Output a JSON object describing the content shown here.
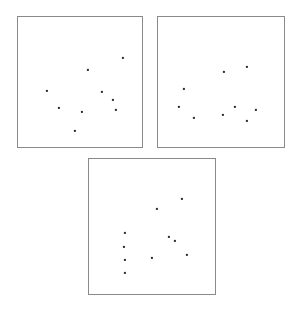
{
  "figure": {
    "title": "",
    "background_color": "#ffffff",
    "width": 300,
    "height": 313,
    "panel_border_color": "#8a8a8a",
    "point_color": "#2b2b2b",
    "point_size_px": 2.2
  },
  "chart_data": {
    "type": "scatter",
    "title": "",
    "xlabel": "",
    "ylabel": "",
    "grid": false,
    "legend_position": "none",
    "axis_ticks": false,
    "panel_layout": "2 panels on top row, 1 panel centered on bottom row",
    "panels": [
      {
        "name": "panel-top-left",
        "label": "",
        "frame_px": {
          "left": 17,
          "top": 16,
          "width": 126,
          "height": 132
        },
        "xlim": [
          0,
          1
        ],
        "ylim": [
          0,
          1
        ],
        "n_points": 9,
        "points": [
          {
            "x": 0.833,
            "y": 0.689
          },
          {
            "x": 0.556,
            "y": 0.598
          },
          {
            "x": 0.23,
            "y": 0.439
          },
          {
            "x": 0.667,
            "y": 0.432
          },
          {
            "x": 0.754,
            "y": 0.371
          },
          {
            "x": 0.325,
            "y": 0.311
          },
          {
            "x": 0.508,
            "y": 0.28
          },
          {
            "x": 0.778,
            "y": 0.295
          },
          {
            "x": 0.452,
            "y": 0.136
          }
        ],
        "points_px": [
          {
            "x": 122,
            "y": 57
          },
          {
            "x": 87,
            "y": 69
          },
          {
            "x": 46,
            "y": 90
          },
          {
            "x": 101,
            "y": 91
          },
          {
            "x": 112,
            "y": 99
          },
          {
            "x": 58,
            "y": 107
          },
          {
            "x": 81,
            "y": 111
          },
          {
            "x": 115,
            "y": 109
          },
          {
            "x": 74,
            "y": 130
          }
        ]
      },
      {
        "name": "panel-top-right",
        "label": "",
        "frame_px": {
          "left": 157,
          "top": 16,
          "width": 128,
          "height": 132
        },
        "xlim": [
          0,
          1
        ],
        "ylim": [
          0,
          1
        ],
        "n_points": 9,
        "points": [
          {
            "x": 0.516,
            "y": 0.583
          },
          {
            "x": 0.695,
            "y": 0.621
          },
          {
            "x": 0.203,
            "y": 0.455
          },
          {
            "x": 0.164,
            "y": 0.318
          },
          {
            "x": 0.602,
            "y": 0.318
          },
          {
            "x": 0.766,
            "y": 0.295
          },
          {
            "x": 0.281,
            "y": 0.235
          },
          {
            "x": 0.508,
            "y": 0.258
          },
          {
            "x": 0.695,
            "y": 0.212
          }
        ],
        "points_px": [
          {
            "x": 223,
            "y": 71
          },
          {
            "x": 246,
            "y": 66
          },
          {
            "x": 183,
            "y": 88
          },
          {
            "x": 178,
            "y": 106
          },
          {
            "x": 234,
            "y": 106
          },
          {
            "x": 255,
            "y": 109
          },
          {
            "x": 193,
            "y": 117
          },
          {
            "x": 222,
            "y": 114
          },
          {
            "x": 246,
            "y": 120
          }
        ]
      },
      {
        "name": "panel-bottom-center",
        "label": "",
        "frame_px": {
          "left": 88,
          "top": 158,
          "width": 128,
          "height": 137
        },
        "xlim": [
          0,
          1
        ],
        "ylim": [
          0,
          1
        ],
        "n_points": 10,
        "points": [
          {
            "x": 0.727,
            "y": 0.708
          },
          {
            "x": 0.531,
            "y": 0.635
          },
          {
            "x": 0.281,
            "y": 0.46
          },
          {
            "x": 0.625,
            "y": 0.431
          },
          {
            "x": 0.672,
            "y": 0.401
          },
          {
            "x": 0.273,
            "y": 0.358
          },
          {
            "x": 0.492,
            "y": 0.277
          },
          {
            "x": 0.766,
            "y": 0.299
          },
          {
            "x": 0.281,
            "y": 0.263
          },
          {
            "x": 0.281,
            "y": 0.168
          }
        ],
        "points_px": [
          {
            "x": 181,
            "y": 198
          },
          {
            "x": 156,
            "y": 208
          },
          {
            "x": 124,
            "y": 232
          },
          {
            "x": 168,
            "y": 236
          },
          {
            "x": 174,
            "y": 240
          },
          {
            "x": 123,
            "y": 246
          },
          {
            "x": 151,
            "y": 257
          },
          {
            "x": 186,
            "y": 254
          },
          {
            "x": 124,
            "y": 259
          },
          {
            "x": 124,
            "y": 272
          }
        ]
      }
    ]
  }
}
